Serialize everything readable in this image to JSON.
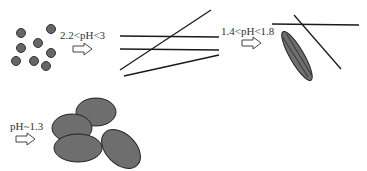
{
  "stages": [
    {
      "id": "dots",
      "label": "2.2<pH<3"
    },
    {
      "id": "lines",
      "label": "1.4<pH<1.8"
    },
    {
      "id": "spindle",
      "label": "pH~1.3"
    },
    {
      "id": "ellipses",
      "label": ""
    }
  ],
  "colors": {
    "fill": "#6e6e6e",
    "stroke": "#222222",
    "line": "#1a1a1a"
  }
}
